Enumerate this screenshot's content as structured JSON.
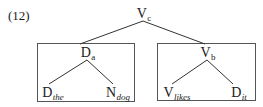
{
  "example_number": "(12)",
  "tree": {
    "root": {
      "label": "V",
      "subscript": "c",
      "subscript_italic": false
    },
    "left_subtree": {
      "boxed": true,
      "head": {
        "label": "D",
        "subscript": "a",
        "subscript_italic": false
      },
      "children": [
        {
          "label": "D",
          "subscript": "the",
          "subscript_italic": true
        },
        {
          "label": "N",
          "subscript": "dog",
          "subscript_italic": true
        }
      ]
    },
    "right_subtree": {
      "boxed": true,
      "head": {
        "label": "V",
        "subscript": "b",
        "subscript_italic": false
      },
      "children": [
        {
          "label": "V",
          "subscript": "likes",
          "subscript_italic": true
        },
        {
          "label": "D",
          "subscript": "it",
          "subscript_italic": true
        }
      ]
    }
  },
  "colors": {
    "line": "#333333",
    "box_border": "#555555",
    "text": "#1a1a1a",
    "background": "#ffffff"
  }
}
